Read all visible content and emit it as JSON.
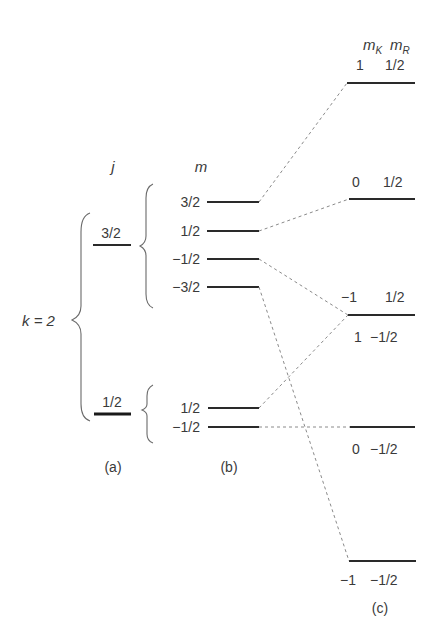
{
  "diagram": {
    "k_label": "k = 2",
    "column_a": {
      "header": "j",
      "caption": "(a)",
      "levels": [
        {
          "j": "3/2"
        },
        {
          "j": "1/2"
        }
      ]
    },
    "column_b": {
      "header": "m",
      "caption": "(b)",
      "group_3_2": [
        "3/2",
        "1/2",
        "−1/2",
        "−3/2"
      ],
      "group_1_2": [
        "1/2",
        "−1/2"
      ]
    },
    "column_c": {
      "header_mk": "m",
      "header_mk_sub": "K",
      "header_mr": "m",
      "header_mr_sub": "R",
      "caption": "(c)",
      "levels": [
        {
          "mK": "1",
          "mR": "1/2"
        },
        {
          "mK": "0",
          "mR": "1/2"
        },
        {
          "mK": "−1",
          "mR": "1/2",
          "mK2": "1",
          "mR2": "−1/2"
        },
        {
          "mK": "0",
          "mR": "−1/2"
        },
        {
          "mK": "−1",
          "mR": "−1/2"
        }
      ]
    },
    "connections": [
      {
        "from": "m=3/2",
        "to": "mK=1,mR=1/2"
      },
      {
        "from": "m=1/2",
        "to": "mK=0,mR=1/2"
      },
      {
        "from": "m=-1/2",
        "to": "mK=-1,mR=1/2"
      },
      {
        "from": "m=-3/2",
        "to": "mK=-1,mR=-1/2"
      },
      {
        "from": "m=1/2 (j=1/2)",
        "to": "mK=1,mR=-1/2"
      },
      {
        "from": "m=-1/2 (j=1/2)",
        "to": "mK=0,mR=-1/2"
      }
    ]
  }
}
